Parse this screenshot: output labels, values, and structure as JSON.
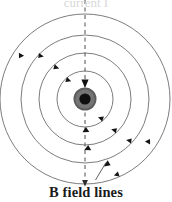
{
  "figure": {
    "name": "magnetic-field-around-current-carrying-wire",
    "caption": "B field lines",
    "top_clipped_text": "current I",
    "background_color": "#ffffff",
    "line_color": "#555555",
    "arrow_color": "#1a1a1a",
    "text_color": "#1b1b1b"
  },
  "conductor": {
    "label": "wire-cross-section",
    "center_x": 85,
    "center_y": 99,
    "outer_radius": 11.5,
    "outer_ring_color": "#555555",
    "mid_radius": 9.5,
    "mid_fill_color": "#6e6e6e",
    "inner_radius": 5.5,
    "inner_fill_color": "#111111"
  },
  "field_lines": {
    "label": "concentric-magnetic-field-circles",
    "count": 4,
    "direction": "clockwise",
    "stroke_width": 0.8,
    "radii": [
      28,
      46,
      64,
      85
    ]
  },
  "direction_arrows": {
    "label": "field-direction-arrowheads",
    "size": 4.2,
    "markers": [
      {
        "radius": 28,
        "angle_deg": -52
      },
      {
        "radius": 28,
        "angle_deg": 128
      },
      {
        "radius": 28,
        "angle_deg": 88
      },
      {
        "radius": 46,
        "angle_deg": -48
      },
      {
        "radius": 46,
        "angle_deg": 131
      },
      {
        "radius": 46,
        "angle_deg": 86
      },
      {
        "radius": 64,
        "angle_deg": -44
      },
      {
        "radius": 64,
        "angle_deg": 136
      },
      {
        "radius": 85,
        "angle_deg": -40
      },
      {
        "radius": 85,
        "angle_deg": 141
      },
      {
        "radius": 85,
        "angle_deg": 66
      }
    ]
  },
  "axis_line": {
    "label": "current-axis-dashed-line",
    "x": 85,
    "y_top": 0,
    "y_bottom": 182,
    "dash_pattern": "4 3.5",
    "stroke_width": 1.0,
    "color": "#4d4d4d",
    "arrow_y": 83,
    "arrow_label": "downward-current-arrow"
  },
  "leader_line": {
    "label": "caption-leader-line",
    "x1": 95,
    "y1": 180,
    "x2": 106,
    "y2": 163,
    "color": "#4d4d4d"
  },
  "bottom_tick": {
    "label": "bottom-axis-arrow",
    "x": 85,
    "y": 182
  }
}
